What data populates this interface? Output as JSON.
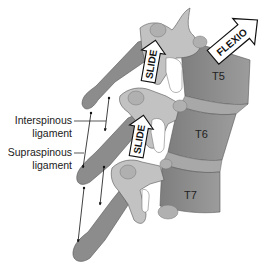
{
  "figure": {
    "vertebrae": [
      {
        "label": "T5"
      },
      {
        "label": "T6"
      },
      {
        "label": "T7"
      }
    ],
    "motion_arrows": [
      {
        "label": "FLEXIO"
      },
      {
        "label": "SLIDE"
      },
      {
        "label": "SLIDE"
      }
    ],
    "annotations": [
      {
        "line1": "Interspinous",
        "line2": "ligament"
      },
      {
        "line1": "Supraspinous",
        "line2": "ligament"
      }
    ],
    "colors": {
      "bone_dark": "#8a8a8a",
      "bone_light": "#c4c4c4",
      "disc": "#9a9a9a",
      "facet": "#b3b3b3",
      "outline": "#3a3a3a",
      "arrow_fill": "#ffffff"
    }
  }
}
